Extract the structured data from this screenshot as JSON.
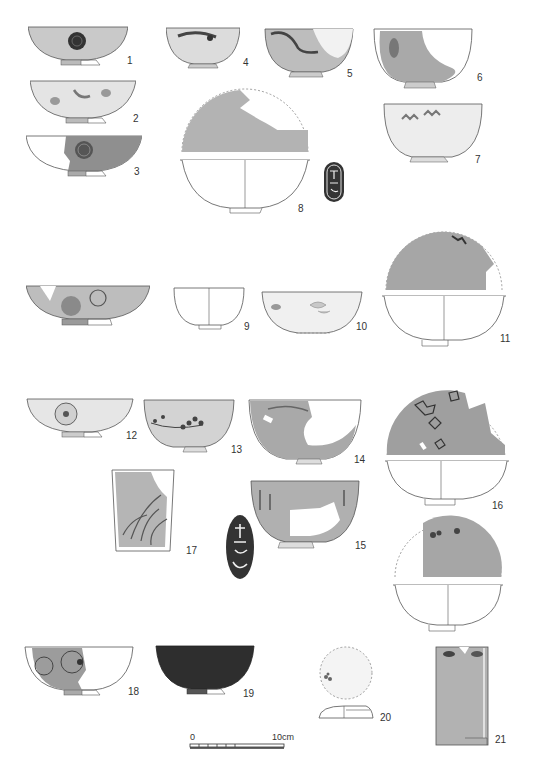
{
  "plate": {
    "type": "archaeological ceramics figure plate",
    "figures": [
      {
        "n": "1",
        "label": "1",
        "form": "bowl",
        "decoration": "chrysanthemum roundel",
        "x": 28,
        "y": 26,
        "w": 100,
        "h": 36
      },
      {
        "n": "2",
        "label": "2",
        "form": "bowl",
        "decoration": "scattered floral sprigs",
        "x": 30,
        "y": 80,
        "w": 106,
        "h": 40
      },
      {
        "n": "3",
        "label": "3",
        "form": "bowl (section + elevation)",
        "decoration": "chrysanthemum roundel on dark ground",
        "x": 26,
        "y": 135,
        "w": 116,
        "h": 42
      },
      {
        "n": "4",
        "label": "4",
        "form": "cup",
        "decoration": "floral band",
        "x": 166,
        "y": 27,
        "w": 72,
        "h": 40
      },
      {
        "n": "5",
        "label": "5",
        "form": "bowl",
        "decoration": "landscape/branch",
        "x": 263,
        "y": 28,
        "w": 90,
        "h": 48
      },
      {
        "n": "6",
        "label": "6",
        "form": "deep bowl",
        "decoration": "partial design",
        "x": 372,
        "y": 28,
        "w": 100,
        "h": 60
      },
      {
        "n": "7",
        "label": "7",
        "form": "bowl",
        "decoration": "butterfly/floral sprigs",
        "x": 382,
        "y": 103,
        "w": 100,
        "h": 58
      },
      {
        "n": "8",
        "label": "8",
        "form": "bowl (interior view + section)",
        "decoration": "fragmentary",
        "x": 180,
        "y": 80,
        "w": 128,
        "h": 130
      },
      {
        "n": "8-mark",
        "label": "",
        "form": "maker's mark (seal)",
        "decoration": "seal characters",
        "x": 323,
        "y": 161,
        "w": 22,
        "h": 42
      },
      {
        "n": "9",
        "label": "9",
        "form": "shallow bowl",
        "decoration": "chrysanthemum roundels",
        "x": 26,
        "y": 285,
        "w": 122,
        "h": 40
      },
      {
        "n": "10",
        "label": "10",
        "form": "cup (section)",
        "decoration": "none",
        "x": 173,
        "y": 287,
        "w": 70,
        "h": 42
      },
      {
        "n": "11",
        "label": "11",
        "form": "bowl",
        "decoration": "floral sprigs",
        "x": 260,
        "y": 291,
        "w": 102,
        "h": 45
      },
      {
        "n": "12",
        "label": "12",
        "form": "bowl (interior view + section)",
        "decoration": "fragmentary rim design",
        "x": 382,
        "y": 228,
        "w": 120,
        "h": 118
      },
      {
        "n": "13",
        "label": "13",
        "form": "bowl",
        "decoration": "chrysanthemum roundel",
        "x": 26,
        "y": 398,
        "w": 106,
        "h": 40
      },
      {
        "n": "14",
        "label": "14",
        "form": "bowl",
        "decoration": "plum blossom branch",
        "x": 143,
        "y": 399,
        "w": 90,
        "h": 53
      },
      {
        "n": "15",
        "label": "15",
        "form": "deep bowl",
        "decoration": "floral band",
        "x": 248,
        "y": 399,
        "w": 112,
        "h": 65
      },
      {
        "n": "16",
        "label": "16",
        "form": "deep bowl",
        "decoration": "grass motifs",
        "x": 250,
        "y": 480,
        "w": 108,
        "h": 68
      },
      {
        "n": "16-mark",
        "label": "",
        "form": "maker's mark (seal)",
        "decoration": "seal characters",
        "x": 225,
        "y": 514,
        "w": 30,
        "h": 66
      },
      {
        "n": "17",
        "label": "17",
        "form": "bowl (interior view + section)",
        "decoration": "floral sprays",
        "x": 385,
        "y": 385,
        "w": 122,
        "h": 120
      },
      {
        "n": "18",
        "label": "18",
        "form": "bowl (interior view + section)",
        "decoration": "floral sprays",
        "x": 393,
        "y": 515,
        "w": 108,
        "h": 115
      },
      {
        "n": "19",
        "label": "19",
        "form": "tumbler/cup",
        "decoration": "grass/reed motif",
        "x": 111,
        "y": 469,
        "w": 62,
        "h": 82
      },
      {
        "n": "20",
        "label": "20",
        "form": "bowl",
        "decoration": "chrysanthemum roundels",
        "x": 24,
        "y": 646,
        "w": 108,
        "h": 47
      },
      {
        "n": "21",
        "label": "21",
        "form": "bowl (dark glaze)",
        "decoration": "solid dark",
        "x": 155,
        "y": 645,
        "w": 98,
        "h": 48
      },
      {
        "n": "22",
        "label": "22",
        "form": "lid (top view + section)",
        "decoration": "small floral",
        "x": 318,
        "y": 646,
        "w": 55,
        "h": 74
      },
      {
        "n": "23",
        "label": "23",
        "form": "tall cylindrical vessel",
        "decoration": "leaf/petal motifs",
        "x": 435,
        "y": 646,
        "w": 52,
        "h": 98
      }
    ]
  },
  "scale_bar": {
    "start_label": "0",
    "end_label": "10cm"
  },
  "colors": {
    "glaze_mid": "#a8a8a8",
    "glaze_light": "#d8d8d8",
    "dark": "#2e2e2e",
    "line": "#555555"
  }
}
